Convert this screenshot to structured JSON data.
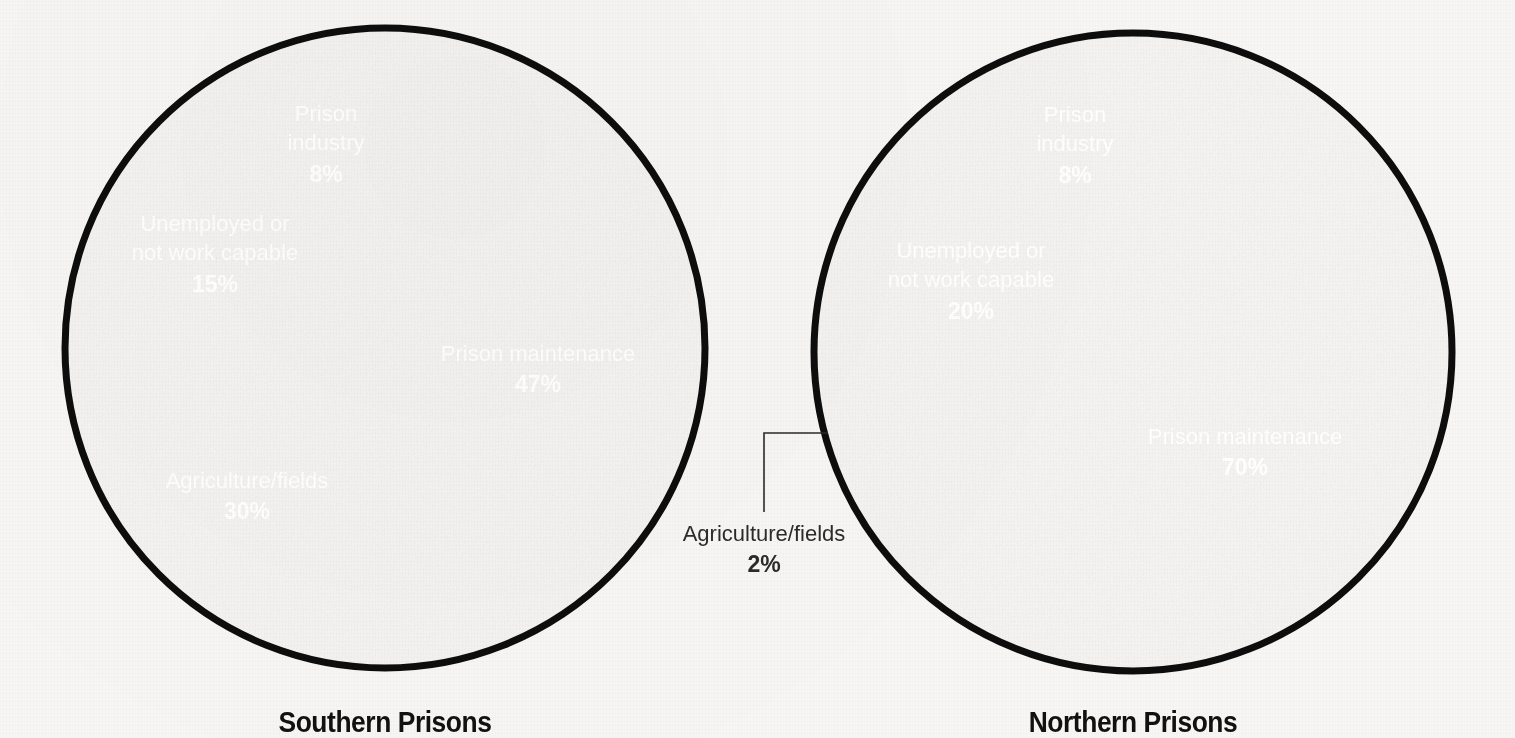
{
  "background_color": "#f7f6f4",
  "outline_color": "#0d0d0d",
  "label_color": "#ffffff",
  "callout_color": "#2b2b2b",
  "chart_data": [
    {
      "type": "pie",
      "title": "Southern Prisons",
      "xlabel": "",
      "ylabel": "",
      "legend_position": "none",
      "grid": false,
      "center": [
        385,
        348
      ],
      "radius": 320,
      "start_angle_deg": 0,
      "direction": "clockwise",
      "categories": [
        "Prison maintenance",
        "Agriculture/fields",
        "Unemployed or not work capable",
        "Prison industry"
      ],
      "values": [
        47,
        30,
        15,
        8
      ],
      "value_labels": [
        "47%",
        "30%",
        "15%",
        "8%"
      ],
      "colors": [
        "#5c5c5c",
        "#3a3a3a",
        "#616161",
        "#1a1a1a"
      ],
      "slices": [
        {
          "label_lines": [
            "Prison maintenance"
          ],
          "percent_label": "47%",
          "value": 47,
          "color": "#5c5c5c",
          "label_x": 538,
          "label_y": 355,
          "label_inside": true
        },
        {
          "label_lines": [
            "Agriculture/fields"
          ],
          "percent_label": "30%",
          "value": 30,
          "color": "#3a3a3a",
          "label_x": 247,
          "label_y": 482,
          "label_inside": true
        },
        {
          "label_lines": [
            "Unemployed or",
            "not work capable"
          ],
          "percent_label": "15%",
          "value": 15,
          "color": "#616161",
          "label_x": 215,
          "label_y": 240,
          "label_inside": true
        },
        {
          "label_lines": [
            "Prison",
            "industry"
          ],
          "percent_label": "8%",
          "value": 8,
          "color": "#1a1a1a",
          "label_x": 326,
          "label_y": 130,
          "label_inside": true
        }
      ]
    },
    {
      "type": "pie",
      "title": "Northern Prisons",
      "xlabel": "",
      "ylabel": "",
      "legend_position": "none",
      "grid": false,
      "center": [
        1133,
        352
      ],
      "radius": 319,
      "start_angle_deg": 0,
      "direction": "clockwise",
      "categories": [
        "Prison maintenance",
        "Agriculture/fields",
        "Unemployed or not work capable",
        "Prison industry"
      ],
      "values": [
        70,
        2,
        20,
        8
      ],
      "value_labels": [
        "70%",
        "2%",
        "20%",
        "8%"
      ],
      "colors": [
        "#5c5c5c",
        "#3a3a3a",
        "#616161",
        "#1a1a1a"
      ],
      "slices": [
        {
          "label_lines": [
            "Prison maintenance"
          ],
          "percent_label": "70%",
          "value": 70,
          "color": "#5c5c5c",
          "label_x": 1245,
          "label_y": 438,
          "label_inside": true
        },
        {
          "label_lines": [
            "Agriculture/fields"
          ],
          "percent_label": "2%",
          "value": 2,
          "color": "#3a3a3a",
          "label_x": 764,
          "label_y": 535,
          "label_inside": false,
          "leader": {
            "from_x": 828,
            "from_y": 433,
            "elbow_x": 764,
            "elbow_y": 433,
            "to_x": 764,
            "to_y": 512
          }
        },
        {
          "label_lines": [
            "Unemployed or",
            "not work capable"
          ],
          "percent_label": "20%",
          "value": 20,
          "color": "#616161",
          "label_x": 971,
          "label_y": 267,
          "label_inside": true
        },
        {
          "label_lines": [
            "Prison",
            "industry"
          ],
          "percent_label": "8%",
          "value": 8,
          "color": "#1a1a1a",
          "label_x": 1075,
          "label_y": 131,
          "label_inside": true
        }
      ]
    }
  ],
  "titles": [
    {
      "text": "Southern Prisons",
      "x": 385,
      "y": 732
    },
    {
      "text": "Northern Prisons",
      "x": 1133,
      "y": 732
    }
  ]
}
